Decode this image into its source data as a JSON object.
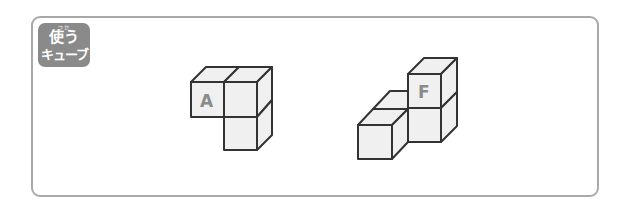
{
  "badge": {
    "ruby": "つか",
    "line1": "使う",
    "line2": "キューブ",
    "color": "#8a8a8a"
  },
  "figures": [
    {
      "id": "A",
      "label": "A",
      "cubes": 3
    },
    {
      "id": "F",
      "label": "F",
      "cubes": 4
    }
  ],
  "colors": {
    "frame": "#a9a9a9",
    "cube_face": "#f0f0f0",
    "cube_edge": "#333333",
    "label": "#8a8a8a"
  }
}
